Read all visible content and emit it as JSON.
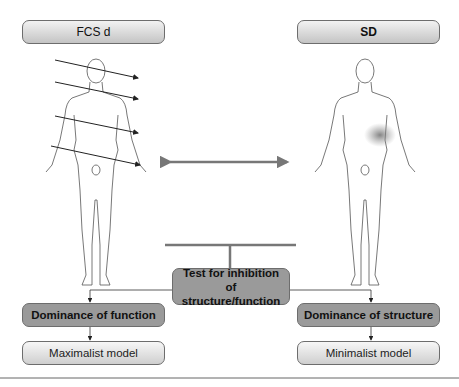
{
  "left_panel": {
    "header": "FCS d",
    "figure": "human-body-front",
    "arrow_count": 4
  },
  "right_panel": {
    "header": "SD",
    "figure": "human-body-front",
    "highlight": "abdominal-region-shaded"
  },
  "center": {
    "test_box": "Test for inhibition of structure/function"
  },
  "left_branch": {
    "dominance": "Dominance of function",
    "model": "Maximalist model"
  },
  "right_branch": {
    "dominance": "Dominance of structure",
    "model": "Minimalist model"
  },
  "colors": {
    "connector": "#777777",
    "dark_box": "#9a9a9a",
    "shade": "#8a8a8a"
  }
}
